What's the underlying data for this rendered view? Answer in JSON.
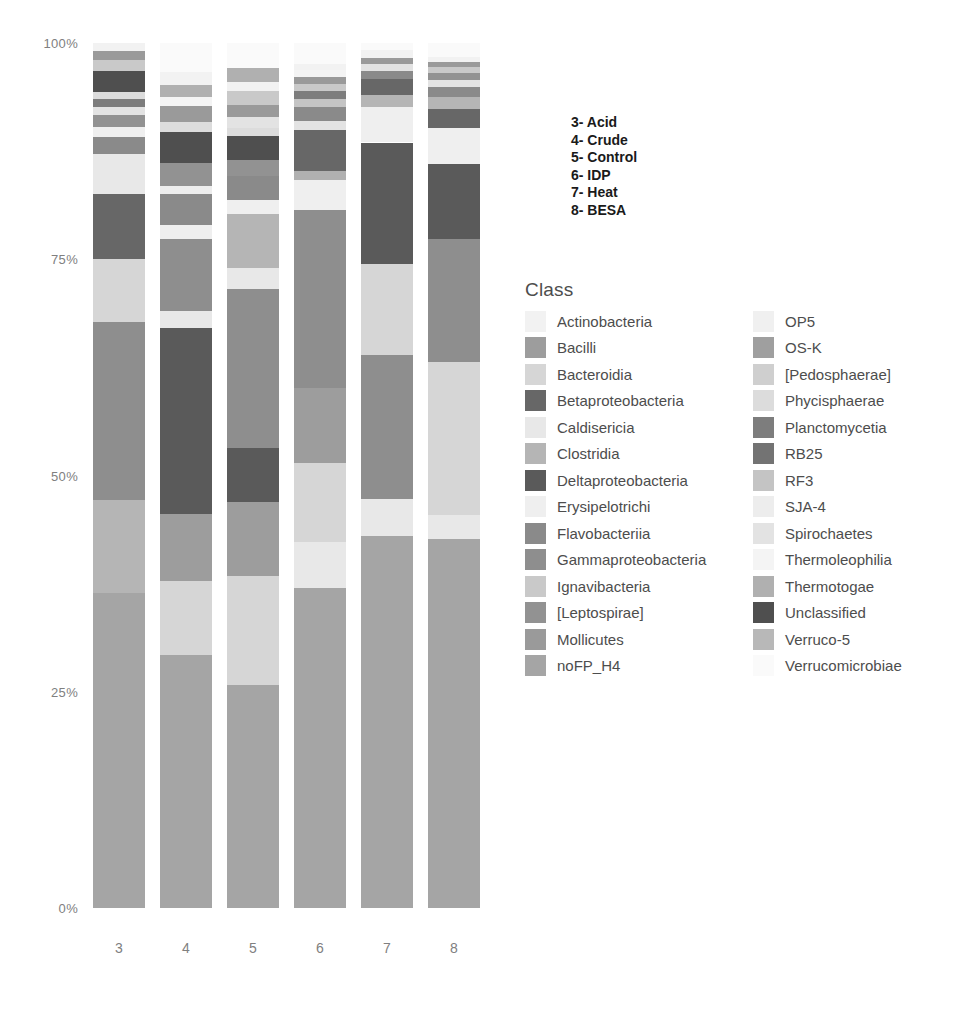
{
  "chart_data": {
    "type": "bar",
    "subtype": "stacked-percent",
    "title": "",
    "xlabel": "",
    "ylabel": "",
    "ylim": [
      0,
      100
    ],
    "grid": false,
    "legend_position": "right",
    "ytick_labels": [
      "100%",
      "75%",
      "50%",
      "25%",
      "0%"
    ],
    "ytick_values": [
      100,
      75,
      50,
      25,
      0
    ],
    "categories": [
      "3",
      "4",
      "5",
      "6",
      "7",
      "8"
    ],
    "category_names": [
      "Acid",
      "Crude",
      "Control",
      "IDP",
      "Heat",
      "BESA"
    ],
    "legend_title": "Class",
    "series": [
      {
        "name": "noFP_H4",
        "color": "#a5a5a5",
        "values": [
          36.8,
          29.3,
          25.8,
          37.0,
          43.0,
          42.7
        ]
      },
      {
        "name": "Erysipelotrichi",
        "color": "#efefef",
        "values": [
          0.0,
          0.0,
          0.0,
          0.0,
          0.0,
          0.0
        ]
      },
      {
        "name": "Clostridia",
        "color": "#b5b5b5",
        "values": [
          10.8,
          0.0,
          0.0,
          0.0,
          0.0,
          0.0
        ]
      },
      {
        "name": "Bacteroidia",
        "color": "#d6d6d6",
        "values": [
          7.4,
          8.5,
          12.6,
          9.2,
          10.5,
          17.7
        ]
      },
      {
        "name": "Bacilli",
        "color": "#9d9d9d",
        "values": [
          0.0,
          7.8,
          8.5,
          8.6,
          0.0,
          0.0
        ]
      },
      {
        "name": "Deltaproteobacteria",
        "color": "#5a5a5a",
        "values": [
          0.0,
          5.4,
          7.6,
          0.0,
          0.0,
          0.0
        ]
      },
      {
        "name": "Gammaproteobacteria",
        "color": "#8e8e8e",
        "values": [
          20.7,
          15.4,
          18.4,
          20.6,
          16.6,
          14.3
        ]
      },
      {
        "name": "Caldisericia",
        "color": "#e8e8e8",
        "values": [
          4.6,
          2.0,
          2.4,
          5.3,
          4.3,
          2.7
        ]
      },
      {
        "name": "Betaproteobacteria",
        "color": "#676767",
        "values": [
          7.6,
          0.0,
          0.0,
          4.7,
          0.0,
          0.0
        ]
      },
      {
        "name": "Flavobacteriia",
        "color": "#8a8a8a",
        "values": [
          2.0,
          3.5,
          2.8,
          1.6,
          1.4,
          1.1
        ]
      },
      {
        "name": "[Leptospirae]",
        "color": "#929292",
        "values": [
          1.4,
          2.6,
          1.9,
          1.0,
          0.9,
          0.8
        ]
      },
      {
        "name": "Ignavibacteria",
        "color": "#c9c9c9",
        "values": [
          1.3,
          2.2,
          1.6,
          0.9,
          0.8,
          0.7
        ]
      },
      {
        "name": "Mollicutes",
        "color": "#9a9a9a",
        "values": [
          1.1,
          1.8,
          1.4,
          0.8,
          0.7,
          0.6
        ]
      },
      {
        "name": "Actinobacteria",
        "color": "#f2f2f2",
        "values": [
          0.9,
          1.4,
          1.1,
          0.7,
          0.6,
          0.6
        ]
      },
      {
        "name": "OP5",
        "color": "#f0f0f0",
        "values": [
          0.4,
          0.6,
          0.5,
          0.4,
          0.4,
          0.4
        ]
      },
      {
        "name": "OS-K",
        "color": "#9f9f9f",
        "values": [
          0.5,
          0.8,
          0.6,
          0.5,
          0.5,
          0.5
        ]
      },
      {
        "name": "[Pedosphaerae]",
        "color": "#cfcfcf",
        "values": [
          0.4,
          0.6,
          0.5,
          0.4,
          0.4,
          0.4
        ]
      },
      {
        "name": "Phycisphaerae",
        "color": "#dcdcdc",
        "values": [
          0.4,
          0.5,
          0.5,
          0.4,
          0.4,
          0.4
        ]
      },
      {
        "name": "Planctomycetia",
        "color": "#7d7d7d",
        "values": [
          0.5,
          0.8,
          0.7,
          0.5,
          0.5,
          0.5
        ]
      },
      {
        "name": "RB25",
        "color": "#737373",
        "values": [
          0.4,
          0.6,
          0.5,
          0.4,
          0.4,
          0.4
        ]
      },
      {
        "name": "RF3",
        "color": "#c4c4c4",
        "values": [
          0.4,
          0.6,
          0.5,
          0.4,
          0.4,
          0.4
        ]
      },
      {
        "name": "SJA-4",
        "color": "#ededed",
        "values": [
          0.3,
          0.5,
          0.4,
          0.3,
          0.3,
          0.3
        ]
      },
      {
        "name": "Spirochaetes",
        "color": "#e3e3e3",
        "values": [
          0.4,
          0.6,
          0.5,
          0.4,
          0.4,
          0.4
        ]
      },
      {
        "name": "Thermoleophilia",
        "color": "#f4f4f4",
        "values": [
          0.3,
          0.4,
          0.4,
          0.3,
          0.3,
          0.3
        ]
      },
      {
        "name": "Thermotogae",
        "color": "#b0b0b0",
        "values": [
          0.5,
          0.8,
          0.7,
          0.5,
          0.5,
          0.5
        ]
      },
      {
        "name": "Unclassified",
        "color": "#4f4f4f",
        "values": [
          0.5,
          0.8,
          0.7,
          0.5,
          0.5,
          0.5
        ]
      },
      {
        "name": "Verruco-5",
        "color": "#b8b8b8",
        "values": [
          0.4,
          0.6,
          0.5,
          0.4,
          0.4,
          0.4
        ]
      },
      {
        "name": "Verrucomicrobiae",
        "color": "#fafafa",
        "values": [
          0.3,
          0.4,
          0.4,
          0.3,
          0.3,
          0.3
        ]
      }
    ]
  },
  "axes": {
    "y_ticks": [
      {
        "label": "100%",
        "pos_pct": 100
      },
      {
        "label": "75%",
        "pos_pct": 75
      },
      {
        "label": "50%",
        "pos_pct": 50
      },
      {
        "label": "25%",
        "pos_pct": 25
      },
      {
        "label": "0%",
        "pos_pct": 0
      }
    ],
    "x_ticks": [
      "3",
      "4",
      "5",
      "6",
      "7",
      "8"
    ]
  },
  "sample_key": {
    "lines": [
      "3- Acid",
      "4- Crude",
      "5- Control",
      "6- IDP",
      "7- Heat",
      "8- BESA"
    ]
  },
  "legend": {
    "title": "Class",
    "column_left": [
      {
        "label": "Actinobacteria",
        "color": "#f2f2f2"
      },
      {
        "label": "Bacilli",
        "color": "#9d9d9d"
      },
      {
        "label": "Bacteroidia",
        "color": "#d6d6d6"
      },
      {
        "label": "Betaproteobacteria",
        "color": "#676767"
      },
      {
        "label": "Caldisericia",
        "color": "#e8e8e8"
      },
      {
        "label": "Clostridia",
        "color": "#b5b5b5"
      },
      {
        "label": "Deltaproteobacteria",
        "color": "#5a5a5a"
      },
      {
        "label": "Erysipelotrichi",
        "color": "#efefef"
      },
      {
        "label": "Flavobacteriia",
        "color": "#8a8a8a"
      },
      {
        "label": "Gammaproteobacteria",
        "color": "#8e8e8e"
      },
      {
        "label": "Ignavibacteria",
        "color": "#c9c9c9"
      },
      {
        "label": "[Leptospirae]",
        "color": "#929292"
      },
      {
        "label": "Mollicutes",
        "color": "#9a9a9a"
      },
      {
        "label": "noFP_H4",
        "color": "#a5a5a5"
      }
    ],
    "column_right": [
      {
        "label": "OP5",
        "color": "#f0f0f0"
      },
      {
        "label": "OS-K",
        "color": "#9f9f9f"
      },
      {
        "label": "[Pedosphaerae]",
        "color": "#cfcfcf"
      },
      {
        "label": "Phycisphaerae",
        "color": "#dcdcdc"
      },
      {
        "label": "Planctomycetia",
        "color": "#7d7d7d"
      },
      {
        "label": "RB25",
        "color": "#737373"
      },
      {
        "label": "RF3",
        "color": "#c4c4c4"
      },
      {
        "label": "SJA-4",
        "color": "#ededed"
      },
      {
        "label": "Spirochaetes",
        "color": "#e3e3e3"
      },
      {
        "label": "Thermoleophilia",
        "color": "#f4f4f4"
      },
      {
        "label": "Thermotogae",
        "color": "#b0b0b0"
      },
      {
        "label": "Unclassified",
        "color": "#4f4f4f"
      },
      {
        "label": "Verruco-5",
        "color": "#b8b8b8"
      },
      {
        "label": "Verrucomicrobiae",
        "color": "#fafafa"
      }
    ]
  },
  "bars": [
    {
      "category": "3",
      "segments": [
        {
          "class": "noFP_H4",
          "color": "#a5a5a5",
          "pct": 36.8
        },
        {
          "class": "Clostridia",
          "color": "#b5b5b5",
          "pct": 10.8
        },
        {
          "class": "Gammaproteobacteria",
          "color": "#8e8e8e",
          "pct": 20.7
        },
        {
          "class": "Bacteroidia",
          "color": "#d6d6d6",
          "pct": 7.4
        },
        {
          "class": "Betaproteobacteria",
          "color": "#676767",
          "pct": 7.6
        },
        {
          "class": "Caldisericia",
          "color": "#e8e8e8",
          "pct": 4.6
        },
        {
          "class": "Flavobacteriia",
          "color": "#8a8a8a",
          "pct": 2.0
        },
        {
          "class": "Erysipelotrichi",
          "color": "#efefef",
          "pct": 1.2
        },
        {
          "class": "[Leptospirae]",
          "color": "#929292",
          "pct": 1.4
        },
        {
          "class": "Spirochaetes",
          "color": "#e3e3e3",
          "pct": 0.9
        },
        {
          "class": "Planctomycetia",
          "color": "#7d7d7d",
          "pct": 1.0
        },
        {
          "class": "Phycisphaerae",
          "color": "#dcdcdc",
          "pct": 0.8
        },
        {
          "class": "Unclassified",
          "color": "#4f4f4f",
          "pct": 2.4
        },
        {
          "class": "Ignavibacteria",
          "color": "#c9c9c9",
          "pct": 1.3
        },
        {
          "class": "Mollicutes",
          "color": "#9a9a9a",
          "pct": 1.1
        },
        {
          "class": "Actinobacteria",
          "color": "#f2f2f2",
          "pct": 0.9
        }
      ]
    },
    {
      "category": "4",
      "segments": [
        {
          "class": "noFP_H4",
          "color": "#a5a5a5",
          "pct": 29.3
        },
        {
          "class": "Bacteroidia",
          "color": "#d6d6d6",
          "pct": 8.5
        },
        {
          "class": "Bacilli",
          "color": "#9d9d9d",
          "pct": 7.8
        },
        {
          "class": "Deltaproteobacteria",
          "color": "#5a5a5a",
          "pct": 21.4
        },
        {
          "class": "Caldisericia",
          "color": "#e8e8e8",
          "pct": 2.0
        },
        {
          "class": "Gammaproteobacteria",
          "color": "#8e8e8e",
          "pct": 8.4
        },
        {
          "class": "Erysipelotrichi",
          "color": "#efefef",
          "pct": 1.6
        },
        {
          "class": "Flavobacteriia",
          "color": "#8a8a8a",
          "pct": 3.5
        },
        {
          "class": "SJA-4",
          "color": "#ededed",
          "pct": 1.0
        },
        {
          "class": "[Leptospirae]",
          "color": "#929292",
          "pct": 2.6
        },
        {
          "class": "Unclassified",
          "color": "#4f4f4f",
          "pct": 3.6
        },
        {
          "class": "Phycisphaerae",
          "color": "#dcdcdc",
          "pct": 1.2
        },
        {
          "class": "Mollicutes",
          "color": "#9a9a9a",
          "pct": 1.8
        },
        {
          "class": "Thermoleophilia",
          "color": "#f4f4f4",
          "pct": 1.1
        },
        {
          "class": "Thermotogae",
          "color": "#b0b0b0",
          "pct": 1.4
        },
        {
          "class": "Actinobacteria",
          "color": "#f2f2f2",
          "pct": 1.4
        },
        {
          "class": "Verrucomicrobiae",
          "color": "#fafafa",
          "pct": 3.4
        }
      ]
    },
    {
      "category": "5",
      "segments": [
        {
          "class": "noFP_H4",
          "color": "#a5a5a5",
          "pct": 25.8
        },
        {
          "class": "Bacteroidia",
          "color": "#d6d6d6",
          "pct": 12.6
        },
        {
          "class": "Bacilli",
          "color": "#9d9d9d",
          "pct": 8.5
        },
        {
          "class": "Deltaproteobacteria",
          "color": "#5a5a5a",
          "pct": 6.3
        },
        {
          "class": "Gammaproteobacteria",
          "color": "#8e8e8e",
          "pct": 18.4
        },
        {
          "class": "Caldisericia",
          "color": "#e8e8e8",
          "pct": 2.4
        },
        {
          "class": "Clostridia",
          "color": "#b5b5b5",
          "pct": 6.2
        },
        {
          "class": "Erysipelotrichi",
          "color": "#efefef",
          "pct": 1.6
        },
        {
          "class": "Flavobacteriia",
          "color": "#8a8a8a",
          "pct": 2.8
        },
        {
          "class": "[Leptospirae]",
          "color": "#929292",
          "pct": 1.9
        },
        {
          "class": "Unclassified",
          "color": "#4f4f4f",
          "pct": 2.7
        },
        {
          "class": "Phycisphaerae",
          "color": "#dcdcdc",
          "pct": 1.0
        },
        {
          "class": "Spirochaetes",
          "color": "#e3e3e3",
          "pct": 1.2
        },
        {
          "class": "Mollicutes",
          "color": "#9a9a9a",
          "pct": 1.4
        },
        {
          "class": "Ignavibacteria",
          "color": "#c9c9c9",
          "pct": 1.6
        },
        {
          "class": "Actinobacteria",
          "color": "#f2f2f2",
          "pct": 1.1
        },
        {
          "class": "Thermotogae",
          "color": "#b0b0b0",
          "pct": 1.6
        },
        {
          "class": "Verrucomicrobiae",
          "color": "#fafafa",
          "pct": 2.9
        }
      ]
    },
    {
      "category": "6",
      "segments": [
        {
          "class": "noFP_H4",
          "color": "#a5a5a5",
          "pct": 37.0
        },
        {
          "class": "Caldisericia",
          "color": "#e8e8e8",
          "pct": 5.3
        },
        {
          "class": "Bacteroidia",
          "color": "#d6d6d6",
          "pct": 9.2
        },
        {
          "class": "Bacilli",
          "color": "#9d9d9d",
          "pct": 8.6
        },
        {
          "class": "Gammaproteobacteria",
          "color": "#8e8e8e",
          "pct": 20.6
        },
        {
          "class": "Erysipelotrichi",
          "color": "#efefef",
          "pct": 3.5
        },
        {
          "class": "Thermotogae",
          "color": "#b0b0b0",
          "pct": 1.0
        },
        {
          "class": "Betaproteobacteria",
          "color": "#676767",
          "pct": 4.7
        },
        {
          "class": "Spirochaetes",
          "color": "#e3e3e3",
          "pct": 1.1
        },
        {
          "class": "Flavobacteriia",
          "color": "#8a8a8a",
          "pct": 1.6
        },
        {
          "class": "RF3",
          "color": "#c4c4c4",
          "pct": 0.9
        },
        {
          "class": "Planctomycetia",
          "color": "#7d7d7d",
          "pct": 0.9
        },
        {
          "class": "Ignavibacteria",
          "color": "#c9c9c9",
          "pct": 0.9
        },
        {
          "class": "Mollicutes",
          "color": "#9a9a9a",
          "pct": 0.8
        },
        {
          "class": "Thermoleophilia",
          "color": "#f4f4f4",
          "pct": 0.8
        },
        {
          "class": "Actinobacteria",
          "color": "#f2f2f2",
          "pct": 0.7
        },
        {
          "class": "Verrucomicrobiae",
          "color": "#fafafa",
          "pct": 2.4
        }
      ]
    },
    {
      "category": "7",
      "segments": [
        {
          "class": "noFP_H4",
          "color": "#a5a5a5",
          "pct": 43.0
        },
        {
          "class": "Caldisericia",
          "color": "#e8e8e8",
          "pct": 4.3
        },
        {
          "class": "Gammaproteobacteria",
          "color": "#8e8e8e",
          "pct": 16.6
        },
        {
          "class": "Bacteroidia",
          "color": "#d6d6d6",
          "pct": 10.5
        },
        {
          "class": "Deltaproteobacteria",
          "color": "#5a5a5a",
          "pct": 14.1
        },
        {
          "class": "Erysipelotrichi",
          "color": "#efefef",
          "pct": 4.1
        },
        {
          "class": "Clostridia",
          "color": "#b5b5b5",
          "pct": 1.4
        },
        {
          "class": "Betaproteobacteria",
          "color": "#676767",
          "pct": 1.8
        },
        {
          "class": "Flavobacteriia",
          "color": "#8a8a8a",
          "pct": 1.0
        },
        {
          "class": "Spirochaetes",
          "color": "#e3e3e3",
          "pct": 0.8
        },
        {
          "class": "Mollicutes",
          "color": "#9a9a9a",
          "pct": 0.7
        },
        {
          "class": "Actinobacteria",
          "color": "#f2f2f2",
          "pct": 0.9
        },
        {
          "class": "Verrucomicrobiae",
          "color": "#fafafa",
          "pct": 0.8
        }
      ]
    },
    {
      "category": "8",
      "segments": [
        {
          "class": "noFP_H4",
          "color": "#a5a5a5",
          "pct": 42.7
        },
        {
          "class": "Caldisericia",
          "color": "#e8e8e8",
          "pct": 2.7
        },
        {
          "class": "Bacteroidia",
          "color": "#d6d6d6",
          "pct": 17.7
        },
        {
          "class": "Gammaproteobacteria",
          "color": "#8e8e8e",
          "pct": 14.3
        },
        {
          "class": "Deltaproteobacteria",
          "color": "#5a5a5a",
          "pct": 8.6
        },
        {
          "class": "Erysipelotrichi",
          "color": "#efefef",
          "pct": 4.2
        },
        {
          "class": "Betaproteobacteria",
          "color": "#676767",
          "pct": 2.2
        },
        {
          "class": "Clostridia",
          "color": "#b5b5b5",
          "pct": 1.4
        },
        {
          "class": "Flavobacteriia",
          "color": "#8a8a8a",
          "pct": 1.1
        },
        {
          "class": "Spirochaetes",
          "color": "#e3e3e3",
          "pct": 0.8
        },
        {
          "class": "[Leptospirae]",
          "color": "#929292",
          "pct": 0.8
        },
        {
          "class": "Ignavibacteria",
          "color": "#c9c9c9",
          "pct": 0.7
        },
        {
          "class": "Mollicutes",
          "color": "#9a9a9a",
          "pct": 0.6
        },
        {
          "class": "Actinobacteria",
          "color": "#f2f2f2",
          "pct": 0.6
        },
        {
          "class": "Verrucomicrobiae",
          "color": "#fafafa",
          "pct": 1.6
        }
      ]
    }
  ]
}
